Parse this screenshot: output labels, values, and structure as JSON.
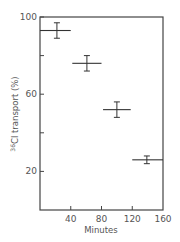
{
  "chart_data": {
    "type": "scatter",
    "title": "",
    "xlabel": "Minutes",
    "ylabel": "36Cl transport (%)",
    "ylabel_sup": "36",
    "ylabel_rest": "Cl transport (%)",
    "xlim": [
      0,
      160
    ],
    "ylim": [
      0,
      100
    ],
    "x_ticks": [
      40,
      80,
      120,
      160
    ],
    "x_tick_labels": [
      "40",
      "80",
      "120",
      "160"
    ],
    "y_ticks": [
      20,
      40,
      60,
      80,
      100
    ],
    "y_tick_labels": [
      "20",
      "",
      "60",
      "",
      "100"
    ],
    "grid": false,
    "legend": null,
    "series": [
      {
        "name": "36Cl transport",
        "points": [
          {
            "x": 22,
            "x_min": 0,
            "x_max": 40,
            "y": 93,
            "y_err": 4
          },
          {
            "x": 61,
            "x_min": 42,
            "x_max": 80,
            "y": 76,
            "y_err": 4
          },
          {
            "x": 100,
            "x_min": 82,
            "x_max": 118,
            "y": 52,
            "y_err": 4
          },
          {
            "x": 139,
            "x_min": 120,
            "x_max": 160,
            "y": 26,
            "y_err": 2
          }
        ]
      }
    ]
  },
  "colors": {
    "line": "#333333",
    "axis": "#444444",
    "text": "#555555"
  }
}
